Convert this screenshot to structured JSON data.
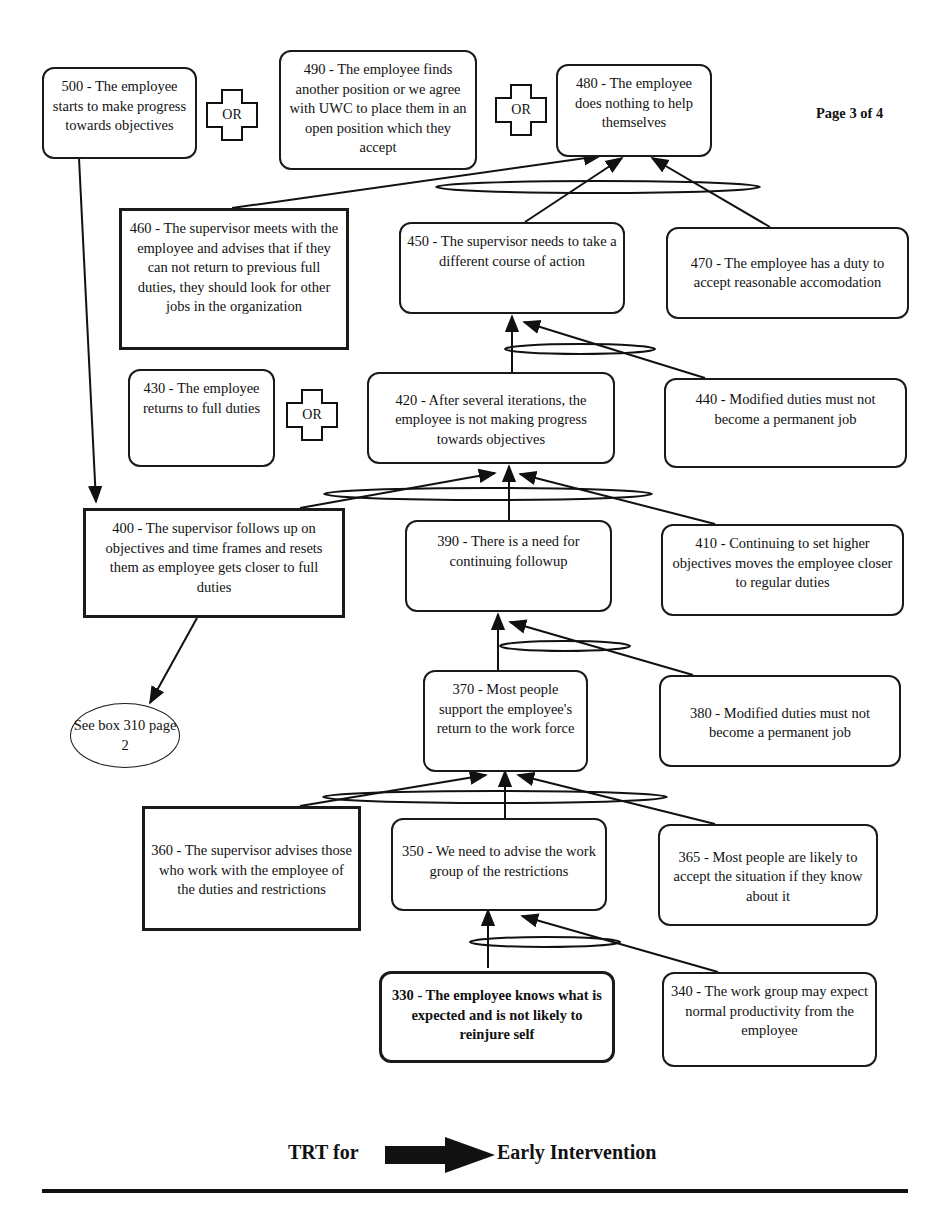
{
  "document": {
    "page_label": "Page 3 of 4",
    "footer": {
      "left_text": "TRT for",
      "arrow_icon": "right-arrow-icon",
      "right_text": "Early Intervention"
    }
  },
  "nodes": {
    "n500": "500 - The employee starts to make progress towards objectives",
    "n490": "490 - The employee finds another position or we agree with UWC to place them in an open position which they accept",
    "n480": "480 - The employee does nothing to help themselves",
    "n460": "460 - The supervisor meets with the employee and advises that if they can not return to previous full duties, they should look for other jobs in the organization",
    "n450": "450 - The supervisor needs to take a different course of action",
    "n470": "470 - The employee has a duty to accept reasonable accomodation",
    "n430": "430 - The employee returns to full duties",
    "n420": "420 - After several iterations, the employee is not making progress towards objectives",
    "n440": "440 - Modified duties must not become a permanent job",
    "n400": "400 - The supervisor follows up on objectives and time frames and resets them as employee gets closer to full duties",
    "n390": "390 - There is a need for continuing followup",
    "n410": "410 - Continuing to set higher objectives moves the employee closer to regular duties",
    "ref310": "See box 310 page 2",
    "n370": "370 - Most people support the employee's return to the work force",
    "n380": "380 - Modified duties must not become a permanent job",
    "n360": "360 - The supervisor advises those who work with the employee of the duties and restrictions",
    "n350": "350 - We need to advise the work group of the restrictions",
    "n365": "365 - Most people are likely to accept the situation if they know about it",
    "n330": "330 - The employee knows what is expected and is not likely to reinjure self",
    "n340": "340 - The work group may expect normal productivity from the employee"
  },
  "or_connectors": {
    "or1": "OR",
    "or2": "OR",
    "or3": "OR"
  },
  "edges": [
    {
      "from": "330",
      "to": "350",
      "and_group": "A"
    },
    {
      "from": "340",
      "to": "350",
      "and_group": "A"
    },
    {
      "from": "360",
      "to": "370",
      "and_group": "B"
    },
    {
      "from": "350",
      "to": "370",
      "and_group": "B"
    },
    {
      "from": "365",
      "to": "370",
      "and_group": "B"
    },
    {
      "from": "370",
      "to": "390",
      "and_group": "C"
    },
    {
      "from": "380",
      "to": "390",
      "and_group": "C"
    },
    {
      "from": "400",
      "to": "420",
      "and_group": "D"
    },
    {
      "from": "390",
      "to": "420",
      "and_group": "D"
    },
    {
      "from": "410",
      "to": "420",
      "and_group": "D"
    },
    {
      "from": "420",
      "to": "450",
      "and_group": "E"
    },
    {
      "from": "440",
      "to": "450",
      "and_group": "E"
    },
    {
      "from": "460",
      "to": "480",
      "and_group": "F"
    },
    {
      "from": "450",
      "to": "480",
      "and_group": "F"
    },
    {
      "from": "470",
      "to": "480",
      "and_group": "F"
    },
    {
      "from": "500",
      "to": "400"
    },
    {
      "from": "400",
      "to": "See box 310 page 2"
    }
  ]
}
